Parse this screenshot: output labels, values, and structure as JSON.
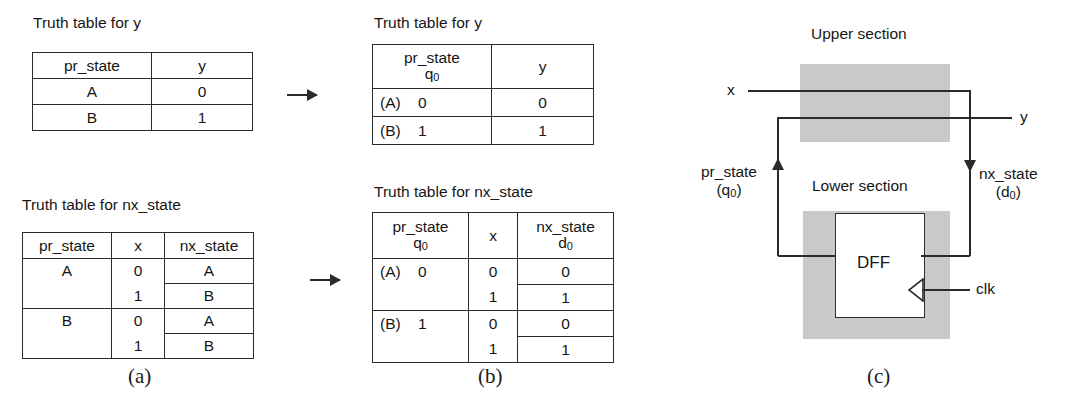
{
  "figure": {
    "panels": [
      {
        "id": "a",
        "label": "(a)"
      },
      {
        "id": "b",
        "label": "(b)"
      },
      {
        "id": "c",
        "label": "(c)"
      }
    ]
  },
  "panel_a": {
    "table_y": {
      "caption": "Truth table for y",
      "headers": [
        "pr_state",
        "y"
      ],
      "rows": [
        {
          "pr_state": "A",
          "y": "0"
        },
        {
          "pr_state": "B",
          "y": "1"
        }
      ]
    },
    "table_nx": {
      "caption": "Truth table for nx_state",
      "headers": [
        "pr_state",
        "x",
        "nx_state"
      ],
      "rows": [
        {
          "pr_state": "A",
          "x": "0",
          "nx_state": "A"
        },
        {
          "pr_state": "",
          "x": "1",
          "nx_state": "B"
        },
        {
          "pr_state": "B",
          "x": "0",
          "nx_state": "A"
        },
        {
          "pr_state": "",
          "x": "1",
          "nx_state": "B"
        }
      ]
    }
  },
  "panel_b": {
    "table_y": {
      "caption": "Truth table for y",
      "header_pr_state": "pr_state",
      "header_pr_state_sub": "q",
      "header_pr_state_sub_idx": "0",
      "header_y": "y",
      "rows": [
        {
          "state": "(A)",
          "q0": "0",
          "y": "0"
        },
        {
          "state": "(B)",
          "q0": "1",
          "y": "1"
        }
      ]
    },
    "table_nx": {
      "caption": "Truth table for nx_state",
      "header_pr_state": "pr_state",
      "header_pr_state_sub": "q",
      "header_pr_state_sub_idx": "0",
      "header_x": "x",
      "header_nx_state": "nx_state",
      "header_nx_state_sub": "d",
      "header_nx_state_sub_idx": "0",
      "rows": [
        {
          "state": "(A)",
          "q0": "0",
          "x": "0",
          "d0": "0"
        },
        {
          "state": "",
          "q0": "",
          "x": "1",
          "d0": "1"
        },
        {
          "state": "(B)",
          "q0": "1",
          "x": "0",
          "d0": "0"
        },
        {
          "state": "",
          "q0": "",
          "x": "1",
          "d0": "1"
        }
      ]
    }
  },
  "panel_c": {
    "upper_section_label": "Upper section",
    "lower_section_label": "Lower section",
    "dff_label": "DFF",
    "input_x": "x",
    "output_y": "y",
    "clk_label": "clk",
    "pr_state_label": "pr_state",
    "pr_state_sub": "(q",
    "pr_state_sub_idx": "0",
    "pr_state_sub_close": ")",
    "nx_state_label": "nx_state",
    "nx_state_sub": "(d",
    "nx_state_sub_idx": "0",
    "nx_state_sub_close": ")",
    "colors": {
      "section_fill": "#c9c9c9",
      "wire": "#2b2b2b",
      "dff_fill": "#ffffff"
    }
  }
}
